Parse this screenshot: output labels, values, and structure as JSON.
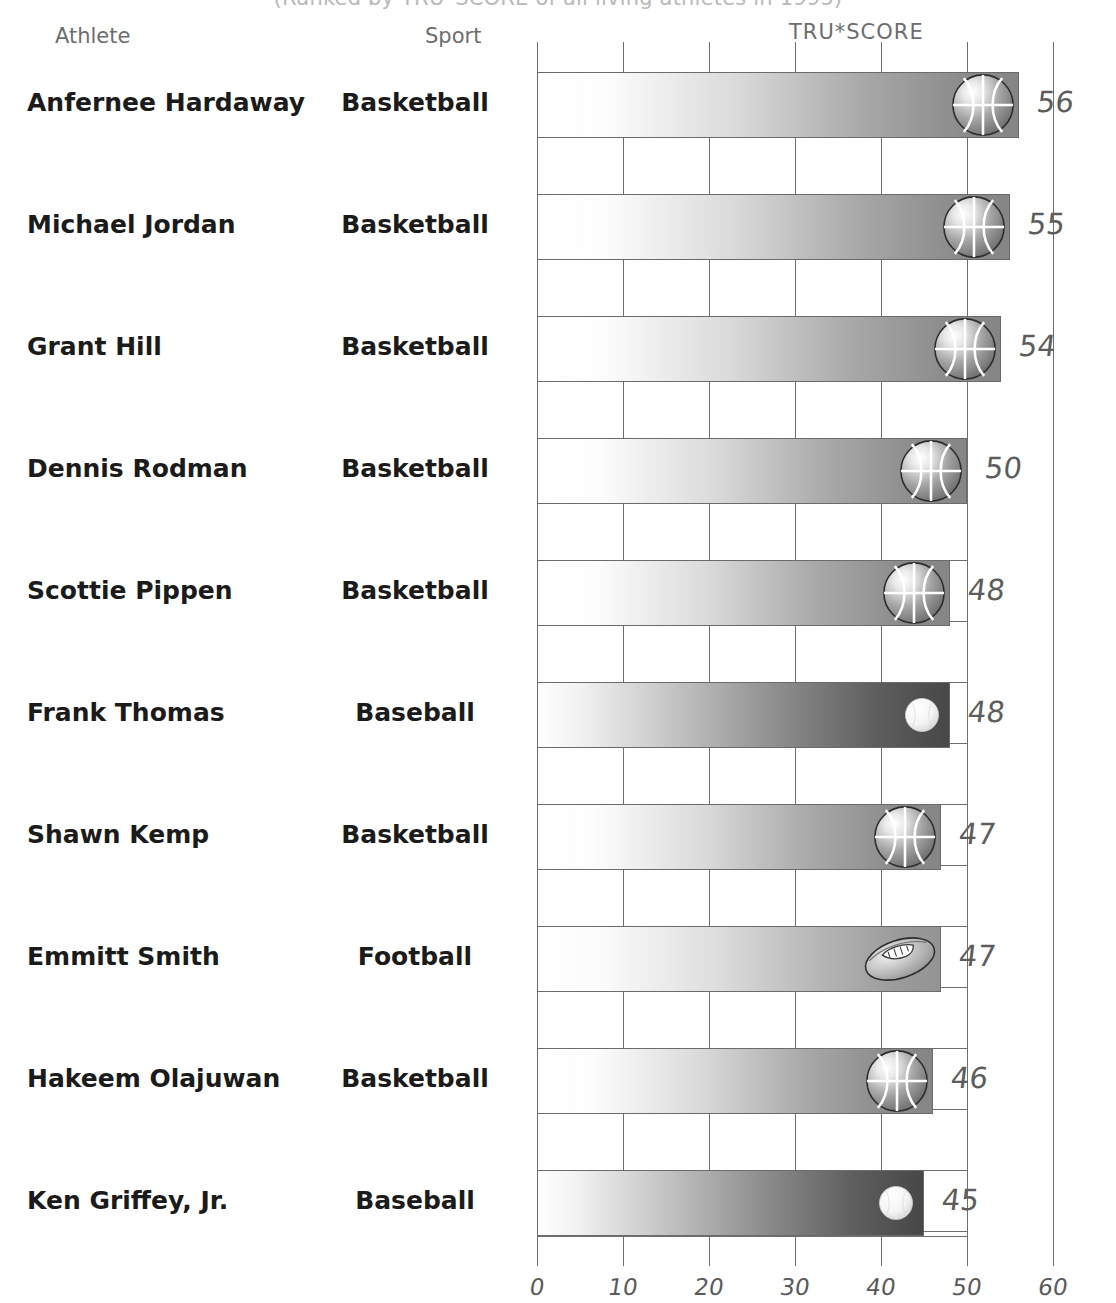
{
  "title": "(Ranked by TRU*SCORE of all living athletes in 1995)",
  "headers": {
    "athlete": "Athlete",
    "sport": "Sport",
    "score": "TRU*SCORE"
  },
  "chart_data": {
    "type": "bar",
    "orientation": "horizontal",
    "title": "(Ranked by TRU*SCORE of all living athletes in 1995)",
    "xlabel": "TRU*SCORE",
    "ylabel": "Athlete",
    "xlim": [
      0,
      60
    ],
    "xticks": [
      "0",
      "10",
      "20",
      "30",
      "40",
      "50",
      "60"
    ],
    "xtick_values": [
      0,
      10,
      20,
      30,
      40,
      50,
      60
    ],
    "grid": true,
    "legend": "none",
    "categories": [
      "Anfernee Hardaway",
      "Michael Jordan",
      "Grant Hill",
      "Dennis Rodman",
      "Scottie Pippen",
      "Frank Thomas",
      "Shawn Kemp",
      "Emmitt Smith",
      "Hakeem Olajuwan",
      "Ken Griffey, Jr."
    ],
    "values": [
      56,
      55,
      54,
      50,
      48,
      48,
      47,
      47,
      46,
      45
    ],
    "sports": [
      "Basketball",
      "Basketball",
      "Basketball",
      "Basketball",
      "Basketball",
      "Baseball",
      "Basketball",
      "Football",
      "Basketball",
      "Baseball"
    ],
    "rows": [
      {
        "athlete": "Anfernee Hardaway",
        "sport": "Basketball",
        "score": 56,
        "score_label": "56",
        "icon": "basketball-icon"
      },
      {
        "athlete": "Michael Jordan",
        "sport": "Basketball",
        "score": 55,
        "score_label": "55",
        "icon": "basketball-icon"
      },
      {
        "athlete": "Grant Hill",
        "sport": "Basketball",
        "score": 54,
        "score_label": "54",
        "icon": "basketball-icon"
      },
      {
        "athlete": "Dennis Rodman",
        "sport": "Basketball",
        "score": 50,
        "score_label": "50",
        "icon": "basketball-icon"
      },
      {
        "athlete": "Scottie Pippen",
        "sport": "Basketball",
        "score": 48,
        "score_label": "48",
        "icon": "basketball-icon"
      },
      {
        "athlete": "Frank Thomas",
        "sport": "Baseball",
        "score": 48,
        "score_label": "48",
        "icon": "baseball-icon"
      },
      {
        "athlete": "Shawn Kemp",
        "sport": "Basketball",
        "score": 47,
        "score_label": "47",
        "icon": "basketball-icon"
      },
      {
        "athlete": "Emmitt Smith",
        "sport": "Football",
        "score": 47,
        "score_label": "47",
        "icon": "football-icon"
      },
      {
        "athlete": "Hakeem Olajuwan",
        "sport": "Basketball",
        "score": 46,
        "score_label": "46",
        "icon": "basketball-icon"
      },
      {
        "athlete": "Ken Griffey, Jr.",
        "sport": "Baseball",
        "score": 45,
        "score_label": "45",
        "icon": "baseball-icon"
      }
    ]
  },
  "colors": {
    "bar_basketball_end": "#858585",
    "bar_baseball_end": "#474747",
    "bar_football_end": "#949494",
    "grid": "#6f6f6f",
    "text": "#1b1b1b",
    "axis_label": "#5a5a5a",
    "header": "#6d6d6d"
  },
  "layout": {
    "x_origin_px": 537,
    "px_per_unit": 8.6,
    "first_bar_top_px": 72,
    "bar_height_px": 66,
    "row_pitch_px": 122
  }
}
